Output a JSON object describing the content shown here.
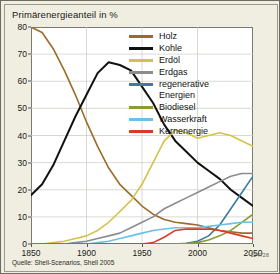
{
  "figure": {
    "title": "Primärenergieanteil in %",
    "source": "Quelle: Shell-Scenarios, Shell 2005",
    "figure_id": "124728",
    "background_color": "#efeee0",
    "plot_background_color": "#ffffff"
  },
  "chart_data": {
    "type": "line",
    "title": "Primärenergieanteil in %",
    "xlabel": "",
    "ylabel": "Primärenergieanteil in %",
    "xlim": [
      1850,
      2050
    ],
    "ylim": [
      0,
      80
    ],
    "xticks": [
      1850,
      1900,
      1950,
      2000,
      2050
    ],
    "yticks": [
      0,
      10,
      20,
      30,
      40,
      50,
      60,
      70,
      80
    ],
    "grid": true,
    "legend_position": "top-right",
    "x": [
      1850,
      1860,
      1870,
      1880,
      1890,
      1900,
      1910,
      1920,
      1930,
      1940,
      1950,
      1960,
      1970,
      1980,
      1990,
      2000,
      2010,
      2020,
      2030,
      2040,
      2050
    ],
    "series": [
      {
        "name": "Holz",
        "color": "#9c6b28",
        "values": [
          80,
          78,
          72,
          64,
          55,
          45,
          36,
          28,
          22,
          18,
          14,
          11,
          9,
          8,
          7.5,
          7,
          6,
          5,
          4.5,
          4,
          4
        ]
      },
      {
        "name": "Kohle",
        "color": "#111111",
        "values": [
          18,
          22,
          29,
          38,
          47,
          55,
          63,
          67,
          66,
          64,
          58,
          52,
          44,
          38,
          34,
          30,
          27,
          24,
          20,
          17,
          14
        ]
      },
      {
        "name": "Erdöl",
        "color": "#d4c24a",
        "values": [
          0,
          0,
          0.5,
          1,
          2,
          3,
          5,
          8,
          12,
          16,
          22,
          30,
          38,
          42,
          41,
          39,
          40,
          41,
          40,
          38,
          36
        ]
      },
      {
        "name": "Erdgas",
        "color": "#8c8c8c",
        "values": [
          0,
          0,
          0,
          0,
          0.5,
          1,
          2,
          3,
          4,
          6,
          8,
          10,
          13,
          15,
          17,
          19,
          21,
          23,
          25,
          26,
          26
        ]
      },
      {
        "name": "regenerative Energien",
        "color": "#3c7a9e",
        "values": [
          0,
          0,
          0,
          0,
          0,
          0,
          0,
          0,
          0,
          0,
          0,
          0,
          0,
          0,
          0.3,
          1,
          3,
          7,
          13,
          19,
          25
        ]
      },
      {
        "name": "Biodiesel",
        "color": "#8b9b30",
        "values": [
          0,
          0,
          0,
          0,
          0,
          0,
          0,
          0,
          0,
          0,
          0,
          0,
          0,
          0,
          0.2,
          0.5,
          1.5,
          3,
          5,
          8,
          11
        ]
      },
      {
        "name": "Wasserkraft",
        "color": "#6bc0e8",
        "values": [
          0,
          0,
          0,
          0,
          0,
          0,
          0.5,
          1,
          2,
          3,
          4,
          5,
          5.5,
          6,
          6,
          6,
          6.5,
          7,
          7.5,
          8,
          8
        ]
      },
      {
        "name": "Kernenergie",
        "color": "#d93a28",
        "values": [
          0,
          0,
          0,
          0,
          0,
          0,
          0,
          0,
          0,
          0,
          0,
          0.5,
          2.5,
          5,
          5.5,
          5.5,
          5.5,
          5,
          4,
          3,
          2
        ]
      }
    ]
  },
  "legend": {
    "items": [
      {
        "label": "Holz",
        "color": "#9c6b28"
      },
      {
        "label": "Kohle",
        "color": "#111111"
      },
      {
        "label": "Erdöl",
        "color": "#d4c24a"
      },
      {
        "label": "Erdgas",
        "color": "#8c8c8c"
      },
      {
        "label": "regenerative\nEnergien",
        "color": "#3c7a9e"
      },
      {
        "label": "Biodiesel",
        "color": "#8b9b30"
      },
      {
        "label": "Wasserkraft",
        "color": "#6bc0e8"
      },
      {
        "label": "Kernenergie",
        "color": "#d93a28"
      }
    ]
  }
}
